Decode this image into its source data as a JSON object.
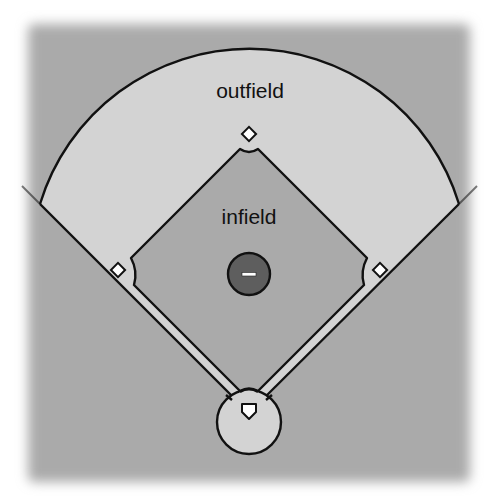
{
  "diagram": {
    "type": "baseball-field",
    "labels": {
      "outfield": "outfield",
      "infield": "infield"
    },
    "regions": [
      "outfield",
      "infield",
      "foul-territory",
      "basepaths",
      "home-plate-circle",
      "pitchers-mound"
    ],
    "bases": [
      "first-base",
      "second-base",
      "third-base",
      "home-plate"
    ],
    "colors": {
      "background": "#aaaaaa",
      "outfield": "#d3d3d3",
      "infield": "#aaaaaa",
      "basepath": "#d3d3d3",
      "mound": "#5e5e5e",
      "outline": "#111111",
      "base": "#ffffff"
    }
  }
}
